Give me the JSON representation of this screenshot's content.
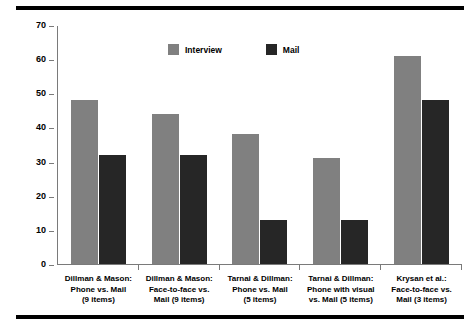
{
  "chart_data": {
    "type": "bar",
    "title": "",
    "xlabel": "",
    "ylabel": "Average percent choosing \"not a problem\"",
    "ylim": [
      0,
      70
    ],
    "yticks": [
      0,
      10,
      20,
      30,
      40,
      50,
      60,
      70
    ],
    "grid": false,
    "legend_position": "top-center",
    "categories": [
      "Dillman & Mason: Phone vs. Mail (9 items)",
      "Dillman & Mason: Face-to-face vs. Mail (9 items)",
      "Tarnai & Dillman: Phone vs. Mail (5 items)",
      "Tarnai & Dillman: Phone with visual vs. Mail (5 items)",
      "Krysan et al.: Face-to-face vs. Mail (3 items)"
    ],
    "category_lines": [
      [
        "Dillman & Mason:",
        "Phone vs. Mail",
        "(9 items)"
      ],
      [
        "Dillman & Mason:",
        "Face-to-face vs.",
        "Mail (9 items)"
      ],
      [
        "Tarnai & Dillman:",
        "Phone vs. Mail",
        "(5 items)"
      ],
      [
        "Tarnai & Dillman:",
        "Phone with visual",
        "vs. Mail (5 items)"
      ],
      [
        "Krysan et al.:",
        "Face-to-face vs.",
        "Mail (3 items)"
      ]
    ],
    "series": [
      {
        "name": "Interview",
        "color": "#808080",
        "values": [
          48,
          44,
          38,
          31,
          61
        ]
      },
      {
        "name": "Mail",
        "color": "#262626",
        "values": [
          32,
          32,
          13,
          13,
          48
        ]
      }
    ]
  },
  "axis": {
    "y_title": "Average percent choosing \"not a problem\"",
    "y_tick_labels": [
      "70",
      "60",
      "50",
      "40",
      "30",
      "20",
      "10",
      "0"
    ]
  },
  "legend": {
    "entries": [
      {
        "label": "Interview",
        "color": "#808080"
      },
      {
        "label": "Mail",
        "color": "#262626"
      }
    ]
  },
  "colors": {
    "interview": "#808080",
    "mail": "#262626",
    "axis": "#7a7a7a",
    "rule": "#000000",
    "background": "#ffffff"
  }
}
